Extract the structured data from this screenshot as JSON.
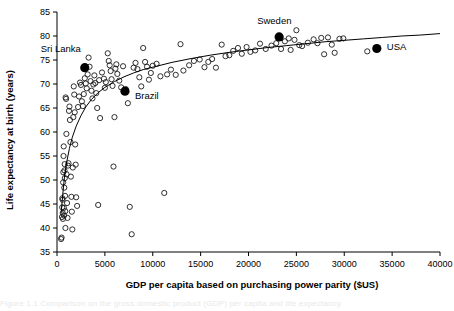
{
  "figure": {
    "background_color": "#ffffff",
    "ink_color": "#000000",
    "cut_caption_fragment": "Figure 1.1   Comparison on the gross domestic product (GDP) per capita and life expectancy"
  },
  "chart_data": {
    "type": "scatter",
    "title": "",
    "xlabel": "GDP per capita based on purchasing power parity ($US)",
    "ylabel": "Life expectancy at birth (years)",
    "xlim": [
      0,
      40000
    ],
    "ylim": [
      35,
      85
    ],
    "xticks": [
      0,
      5000,
      10000,
      15000,
      20000,
      25000,
      30000,
      35000,
      40000
    ],
    "yticks": [
      35,
      40,
      45,
      50,
      55,
      60,
      65,
      70,
      75,
      80,
      85
    ],
    "xtick_labels": [
      "0",
      "5000",
      "10000",
      "15000",
      "20000",
      "25000",
      "30000",
      "35000",
      "40000"
    ],
    "ytick_labels": [
      "35",
      "40",
      "45",
      "50",
      "55",
      "60",
      "65",
      "70",
      "75",
      "80",
      "85"
    ],
    "grid": false,
    "legend": null,
    "marker_style": {
      "unlabelled": "open-circle",
      "highlighted": "filled-circle"
    },
    "trend_line": {
      "description": "logarithmic fit curve",
      "points": [
        [
          430,
          43.0
        ],
        [
          600,
          47.0
        ],
        [
          800,
          51.0
        ],
        [
          1000,
          53.6
        ],
        [
          1300,
          56.6
        ],
        [
          1600,
          58.9
        ],
        [
          2000,
          61.2
        ],
        [
          2500,
          63.4
        ],
        [
          3000,
          65.2
        ],
        [
          3600,
          66.8
        ],
        [
          4300,
          68.2
        ],
        [
          5000,
          69.3
        ],
        [
          6000,
          70.5
        ],
        [
          7000,
          71.5
        ],
        [
          8000,
          72.3
        ],
        [
          9000,
          73.0
        ],
        [
          10000,
          73.5
        ],
        [
          12000,
          74.5
        ],
        [
          14000,
          75.3
        ],
        [
          16000,
          76.0
        ],
        [
          18000,
          76.6
        ],
        [
          20000,
          77.1
        ],
        [
          22000,
          77.6
        ],
        [
          24000,
          78.0
        ],
        [
          26000,
          78.4
        ],
        [
          28000,
          78.8
        ],
        [
          30000,
          79.1
        ],
        [
          32000,
          79.4
        ],
        [
          34000,
          79.7
        ],
        [
          36000,
          80.0
        ],
        [
          38000,
          80.2
        ],
        [
          40000,
          80.5
        ]
      ]
    },
    "highlighted_points": [
      {
        "name": "Sri Lanka",
        "x": 2900,
        "y": 73.4,
        "label_dx": -44,
        "label_dy": -16
      },
      {
        "name": "Brazil",
        "x": 7100,
        "y": 68.5,
        "label_dx": 10,
        "label_dy": 8
      },
      {
        "name": "Sweden",
        "x": 23200,
        "y": 79.8,
        "label_dx": -22,
        "label_dy": -13
      },
      {
        "name": "USA",
        "x": 33400,
        "y": 77.4,
        "label_dx": 10,
        "label_dy": 2
      }
    ],
    "points": [
      [
        430,
        37.7
      ],
      [
        480,
        38.0
      ],
      [
        520,
        42.3
      ],
      [
        540,
        44.3
      ],
      [
        560,
        46.2
      ],
      [
        580,
        45.9
      ],
      [
        600,
        43.1
      ],
      [
        620,
        41.9
      ],
      [
        640,
        49.5
      ],
      [
        660,
        51.6
      ],
      [
        680,
        55.0
      ],
      [
        700,
        57.0
      ],
      [
        720,
        44.2
      ],
      [
        740,
        42.6
      ],
      [
        760,
        48.4
      ],
      [
        780,
        52.0
      ],
      [
        800,
        53.3
      ],
      [
        820,
        50.4
      ],
      [
        840,
        46.7
      ],
      [
        860,
        43.5
      ],
      [
        880,
        40.0
      ],
      [
        900,
        67.2
      ],
      [
        950,
        66.9
      ],
      [
        980,
        59.6
      ],
      [
        1000,
        51.2
      ],
      [
        1050,
        45.2
      ],
      [
        1100,
        42.1
      ],
      [
        1150,
        53.0
      ],
      [
        1200,
        53.5
      ],
      [
        1250,
        64.4
      ],
      [
        1300,
        65.3
      ],
      [
        1350,
        62.5
      ],
      [
        1400,
        57.9
      ],
      [
        1450,
        50.7
      ],
      [
        1500,
        46.5
      ],
      [
        1550,
        43.4
      ],
      [
        1600,
        39.7
      ],
      [
        1650,
        52.6
      ],
      [
        1700,
        63.1
      ],
      [
        1750,
        69.5
      ],
      [
        1800,
        67.8
      ],
      [
        1850,
        64.1
      ],
      [
        1900,
        57.4
      ],
      [
        1950,
        53.2
      ],
      [
        2000,
        46.4
      ],
      [
        2100,
        44.6
      ],
      [
        2200,
        65.2
      ],
      [
        2300,
        67.4
      ],
      [
        2400,
        70.3
      ],
      [
        2500,
        69.8
      ],
      [
        2600,
        66.4
      ],
      [
        2700,
        65.4
      ],
      [
        2800,
        67.9
      ],
      [
        2900,
        71.2
      ],
      [
        3000,
        70.1
      ],
      [
        3100,
        69.1
      ],
      [
        3200,
        72.0
      ],
      [
        3300,
        75.5
      ],
      [
        3400,
        73.6
      ],
      [
        3500,
        70.6
      ],
      [
        3600,
        68.6
      ],
      [
        3700,
        67.0
      ],
      [
        3800,
        69.9
      ],
      [
        3900,
        71.8
      ],
      [
        4000,
        70.2
      ],
      [
        4100,
        68.1
      ],
      [
        4200,
        65.0
      ],
      [
        4300,
        44.8
      ],
      [
        4400,
        70.8
      ],
      [
        4500,
        62.9
      ],
      [
        4700,
        72.4
      ],
      [
        4900,
        71.1
      ],
      [
        5000,
        69.2
      ],
      [
        5100,
        70.4
      ],
      [
        5300,
        76.4
      ],
      [
        5400,
        74.8
      ],
      [
        5500,
        73.9
      ],
      [
        5600,
        72.7
      ],
      [
        5700,
        71.0
      ],
      [
        5800,
        69.6
      ],
      [
        5900,
        52.8
      ],
      [
        6000,
        63.1
      ],
      [
        6100,
        73.2
      ],
      [
        6200,
        74.1
      ],
      [
        6300,
        72.1
      ],
      [
        6500,
        70.7
      ],
      [
        6700,
        69.3
      ],
      [
        6900,
        73.7
      ],
      [
        7200,
        68.9
      ],
      [
        7400,
        66.0
      ],
      [
        7600,
        44.4
      ],
      [
        7800,
        38.7
      ],
      [
        8000,
        73.4
      ],
      [
        8200,
        74.4
      ],
      [
        8400,
        73.1
      ],
      [
        8600,
        71.4
      ],
      [
        8800,
        69.5
      ],
      [
        9000,
        77.5
      ],
      [
        9200,
        74.6
      ],
      [
        9400,
        73.6
      ],
      [
        9600,
        70.9
      ],
      [
        9800,
        72.3
      ],
      [
        10000,
        73.8
      ],
      [
        10400,
        74.2
      ],
      [
        10800,
        71.6
      ],
      [
        11200,
        47.3
      ],
      [
        11500,
        72.0
      ],
      [
        11900,
        73.0
      ],
      [
        12400,
        71.9
      ],
      [
        12900,
        78.3
      ],
      [
        13200,
        72.8
      ],
      [
        13800,
        73.9
      ],
      [
        14300,
        74.8
      ],
      [
        14900,
        75.1
      ],
      [
        15400,
        73.5
      ],
      [
        15800,
        74.6
      ],
      [
        16200,
        75.2
      ],
      [
        16600,
        73.4
      ],
      [
        17200,
        78.2
      ],
      [
        17600,
        75.8
      ],
      [
        18000,
        76.0
      ],
      [
        18400,
        76.9
      ],
      [
        18900,
        77.5
      ],
      [
        19300,
        76.3
      ],
      [
        19800,
        77.7
      ],
      [
        20200,
        76.7
      ],
      [
        20700,
        77.0
      ],
      [
        21200,
        78.4
      ],
      [
        21800,
        77.3
      ],
      [
        22400,
        78.0
      ],
      [
        22900,
        78.5
      ],
      [
        23400,
        77.3
      ],
      [
        23800,
        78.9
      ],
      [
        24200,
        79.5
      ],
      [
        24400,
        77.1
      ],
      [
        24800,
        79.2
      ],
      [
        25000,
        81.2
      ],
      [
        25300,
        78.1
      ],
      [
        25600,
        77.9
      ],
      [
        26200,
        78.6
      ],
      [
        26800,
        79.3
      ],
      [
        27200,
        78.5
      ],
      [
        27600,
        79.6
      ],
      [
        27900,
        76.2
      ],
      [
        28300,
        79.7
      ],
      [
        28700,
        78.2
      ],
      [
        29000,
        76.5
      ],
      [
        29500,
        79.4
      ],
      [
        29900,
        79.5
      ],
      [
        32400,
        76.8
      ]
    ]
  }
}
